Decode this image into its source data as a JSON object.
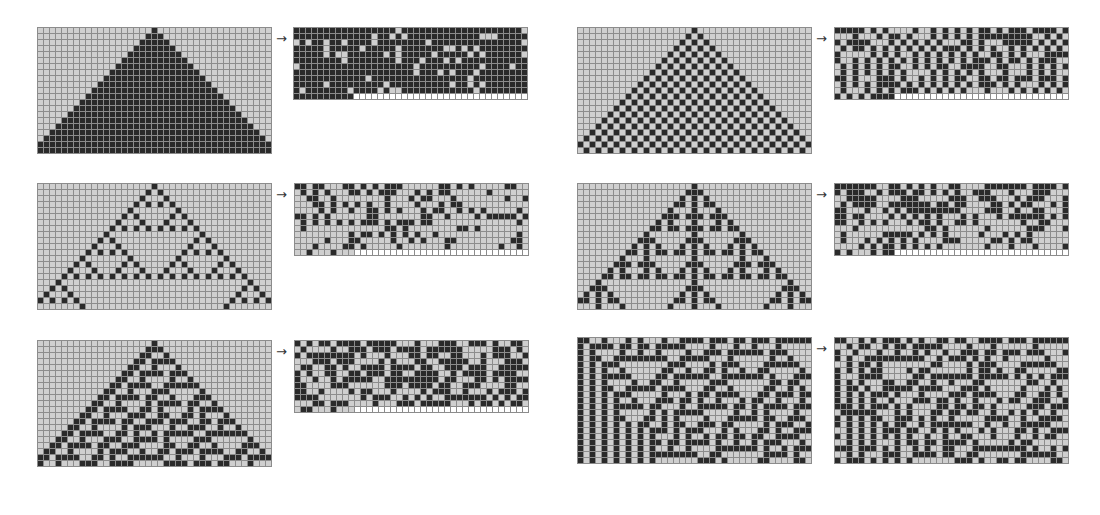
{
  "figure": {
    "arrow_glyph": "→",
    "colors": {
      "on": "#2a2a2a",
      "off": "#cfcfcf",
      "gridline": "#8c8c8c",
      "background": "#ffffff"
    },
    "cols": 39,
    "rows": 21,
    "panels": [
      {
        "id": "rule254",
        "rule": 254,
        "init": "single",
        "evo": {
          "x": 37,
          "y": 27
        },
        "arrow": {
          "x": 276,
          "y": 32
        },
        "seq": {
          "x": 293,
          "y": 27,
          "cols": 39
        }
      },
      {
        "id": "rule250",
        "rule": 250,
        "init": "single",
        "evo": {
          "x": 577,
          "y": 27
        },
        "arrow": {
          "x": 816,
          "y": 32
        },
        "seq": {
          "x": 834,
          "y": 27,
          "cols": 39
        }
      },
      {
        "id": "rule90",
        "rule": 90,
        "init": "single",
        "evo": {
          "x": 37,
          "y": 183
        },
        "arrow": {
          "x": 276,
          "y": 188
        },
        "seq": {
          "x": 294,
          "y": 183,
          "cols": 39
        }
      },
      {
        "id": "rule150",
        "rule": 150,
        "init": "single",
        "evo": {
          "x": 577,
          "y": 183
        },
        "arrow": {
          "x": 816,
          "y": 188
        },
        "seq": {
          "x": 834,
          "y": 183,
          "cols": 39
        }
      },
      {
        "id": "rule30",
        "rule": 30,
        "init": "single",
        "evo": {
          "x": 37,
          "y": 340
        },
        "arrow": {
          "x": 276,
          "y": 345
        },
        "seq": {
          "x": 294,
          "y": 340,
          "cols": 39
        }
      },
      {
        "id": "rule30-random",
        "rule": 30,
        "init": "random",
        "evo": {
          "x": 577,
          "y": 337
        },
        "arrow": {
          "x": 816,
          "y": 342
        },
        "seq": {
          "x": 834,
          "y": 337,
          "cols": 39
        }
      }
    ]
  }
}
